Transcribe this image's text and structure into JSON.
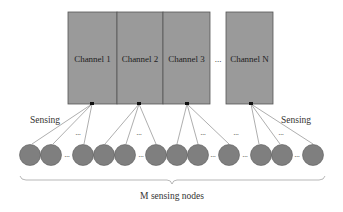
{
  "channels": [
    {
      "label": "Channel 1",
      "x": 68,
      "w": 49,
      "tip": 92
    },
    {
      "label": "Channel 2",
      "x": 117,
      "w": 46,
      "tip": 139
    },
    {
      "label": "Channel 3",
      "x": 163,
      "w": 47,
      "tip": 187
    },
    {
      "label": "Channel N",
      "x": 226,
      "w": 47,
      "tip": 251
    }
  ],
  "channel_ellipsis": "...",
  "sensing_left": "Sensing",
  "sensing_right": "Sensing",
  "nodes_label": "M sensing nodes",
  "node_centers": [
    30,
    51,
    83,
    104,
    125,
    156,
    177,
    198,
    229,
    261,
    282,
    313
  ],
  "colors": {
    "channel_fill": "#9a9a9a",
    "channel_border": "#555555",
    "node_fill": "#7f7f7f",
    "node_border": "#5a5a5a",
    "line": "#777777"
  }
}
